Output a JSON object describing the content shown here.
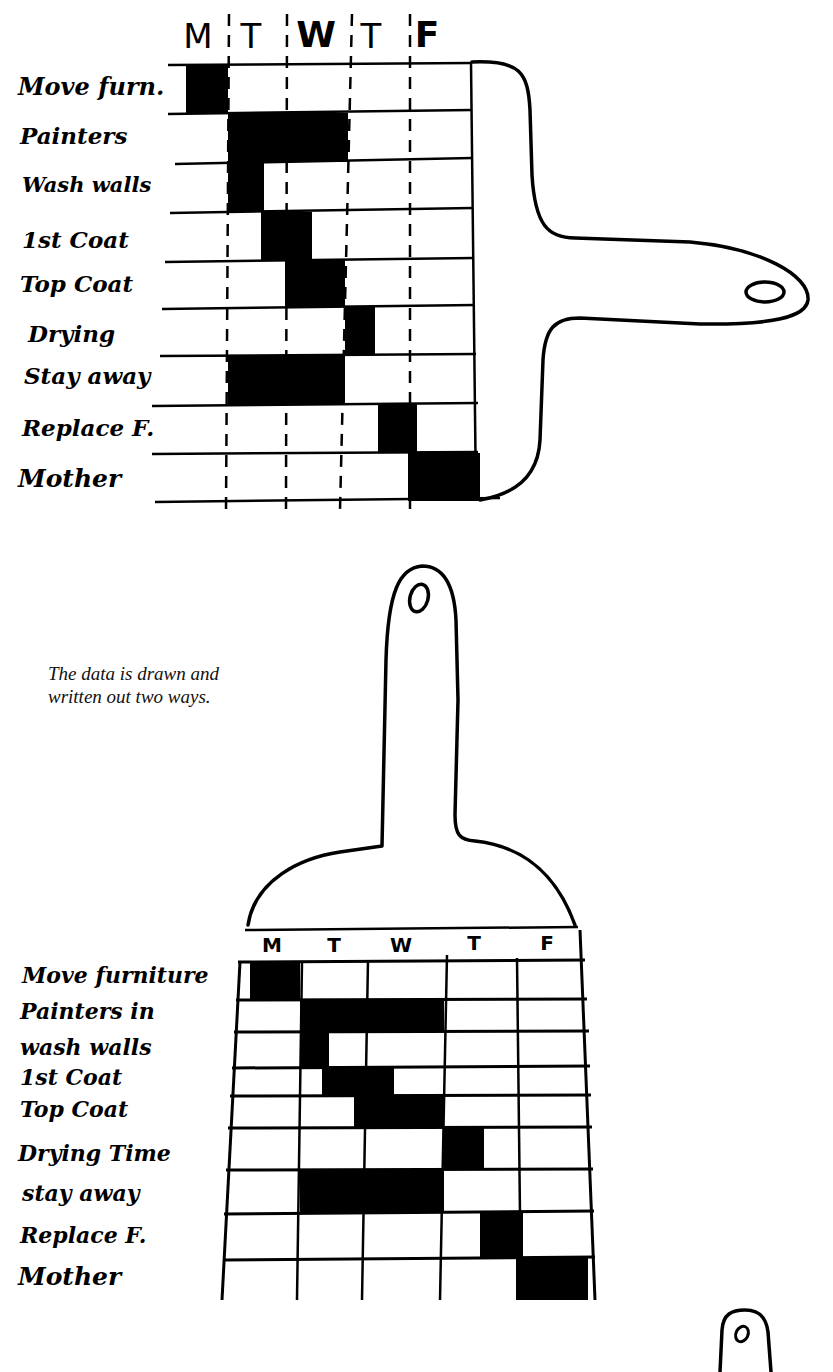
{
  "caption": {
    "line1": "The data is drawn and",
    "line2": "written out two ways."
  },
  "top_chart": {
    "days": [
      "M",
      "T",
      "W",
      "T",
      "F"
    ],
    "rows": [
      {
        "label": "Move furn.",
        "start": 0.3,
        "end": 1.0
      },
      {
        "label": "Painters",
        "start": 1.0,
        "end": 3.0
      },
      {
        "label": "Wash walls",
        "start": 1.0,
        "end": 1.6
      },
      {
        "label": "1st Coat",
        "start": 1.55,
        "end": 2.4
      },
      {
        "label": "Top Coat",
        "start": 1.95,
        "end": 2.95
      },
      {
        "label": "Drying",
        "start": 2.95,
        "end": 3.45
      },
      {
        "label": "Stay away",
        "start": 1.0,
        "end": 2.95
      },
      {
        "label": "Replace F.",
        "start": 3.5,
        "end": 4.15
      },
      {
        "label": "Mother",
        "start": 4.0,
        "end": 5.2
      }
    ]
  },
  "bottom_chart": {
    "days": [
      "M",
      "T",
      "W",
      "T",
      "F"
    ],
    "rows": [
      {
        "label": "Move furniture",
        "start": 0.3,
        "end": 1.0
      },
      {
        "label": "Painters in",
        "start": 1.0,
        "end": 3.0
      },
      {
        "label": "wash walls",
        "start": 1.0,
        "end": 1.4
      },
      {
        "label": "1st Coat",
        "start": 1.3,
        "end": 2.3
      },
      {
        "label": "Top Coat",
        "start": 1.75,
        "end": 3.0
      },
      {
        "label": "Drying Time",
        "start": 3.0,
        "end": 3.55
      },
      {
        "label": "stay away",
        "start": 1.0,
        "end": 3.0
      },
      {
        "label": "Replace F.",
        "start": 3.5,
        "end": 4.1
      },
      {
        "label": "Mother",
        "start": 4.0,
        "end": 5.0
      }
    ]
  },
  "chart_data": [
    {
      "type": "table",
      "title": "Painting schedule (brush-shaped Gantt chart, horizontal)",
      "categories": [
        "M",
        "T",
        "W",
        "T",
        "F"
      ],
      "rows": [
        "Move furn.",
        "Painters",
        "Wash walls",
        "1st Coat",
        "Top Coat",
        "Drying",
        "Stay away",
        "Replace F.",
        "Mother"
      ],
      "series": [
        {
          "name": "Move furn.",
          "start_day": 0.3,
          "end_day": 1.0
        },
        {
          "name": "Painters",
          "start_day": 1.0,
          "end_day": 3.0
        },
        {
          "name": "Wash walls",
          "start_day": 1.0,
          "end_day": 1.6
        },
        {
          "name": "1st Coat",
          "start_day": 1.55,
          "end_day": 2.4
        },
        {
          "name": "Top Coat",
          "start_day": 1.95,
          "end_day": 2.95
        },
        {
          "name": "Drying",
          "start_day": 2.95,
          "end_day": 3.45
        },
        {
          "name": "Stay away",
          "start_day": 1.0,
          "end_day": 2.95
        },
        {
          "name": "Replace F.",
          "start_day": 3.5,
          "end_day": 4.15
        },
        {
          "name": "Mother",
          "start_day": 4.0,
          "end_day": 5.0
        }
      ]
    },
    {
      "type": "table",
      "title": "Painting schedule (brush-shaped Gantt chart, vertical)",
      "categories": [
        "M",
        "T",
        "W",
        "T",
        "F"
      ],
      "rows": [
        "Move furniture",
        "Painters in",
        "wash walls",
        "1st Coat",
        "Top Coat",
        "Drying Time",
        "stay away",
        "Replace F.",
        "Mother"
      ],
      "series": [
        {
          "name": "Move furniture",
          "start_day": 0.3,
          "end_day": 1.0
        },
        {
          "name": "Painters in",
          "start_day": 1.0,
          "end_day": 3.0
        },
        {
          "name": "wash walls",
          "start_day": 1.0,
          "end_day": 1.4
        },
        {
          "name": "1st Coat",
          "start_day": 1.3,
          "end_day": 2.3
        },
        {
          "name": "Top Coat",
          "start_day": 1.75,
          "end_day": 3.0
        },
        {
          "name": "Drying Time",
          "start_day": 3.0,
          "end_day": 3.55
        },
        {
          "name": "stay away",
          "start_day": 1.0,
          "end_day": 3.0
        },
        {
          "name": "Replace F.",
          "start_day": 3.5,
          "end_day": 4.1
        },
        {
          "name": "Mother",
          "start_day": 4.0,
          "end_day": 5.0
        }
      ]
    }
  ]
}
